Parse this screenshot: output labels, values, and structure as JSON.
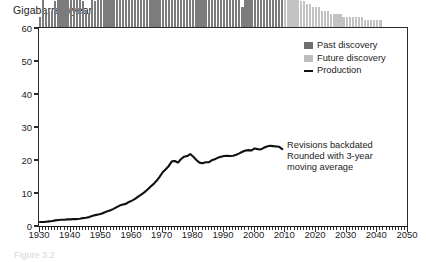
{
  "figure": {
    "axis_title": "Gigabarrels/year",
    "caption": "Figure 3.2"
  },
  "legend": {
    "position": "top-right",
    "items": [
      {
        "label": "Past discovery",
        "marker": "square",
        "color": "#6f6f6f"
      },
      {
        "label": "Future discovery",
        "marker": "square",
        "color": "#bdbdbd"
      },
      {
        "label": "Production",
        "marker": "line",
        "color": "#111111"
      }
    ]
  },
  "annotation": {
    "lines": [
      "Revisions backdated",
      "Rounded with 3-year",
      "moving average"
    ]
  },
  "colors": {
    "past_discovery": "#7c7c7c",
    "future_discovery": "#c3c3c3",
    "production_line": "#111111",
    "axis": "#2b2b2b",
    "background": "#ffffff"
  },
  "chart_data": {
    "type": "bar",
    "title": "Gigabarrels/year",
    "xlabel": "",
    "ylabel": "Gigabarrels/year",
    "xlim": [
      1930,
      2050
    ],
    "ylim": [
      0,
      60
    ],
    "yticks": [
      0,
      10,
      20,
      30,
      40,
      50,
      60
    ],
    "xticks": [
      1930,
      1940,
      1950,
      1960,
      1970,
      1980,
      1990,
      2000,
      2010,
      2020,
      2030,
      2040,
      2050
    ],
    "xtick_minor_step": 1,
    "grid": false,
    "legend_position": "top-right",
    "x": [
      1930,
      1931,
      1932,
      1933,
      1934,
      1935,
      1936,
      1937,
      1938,
      1939,
      1940,
      1941,
      1942,
      1943,
      1944,
      1945,
      1946,
      1947,
      1948,
      1949,
      1950,
      1951,
      1952,
      1953,
      1954,
      1955,
      1956,
      1957,
      1958,
      1959,
      1960,
      1961,
      1962,
      1963,
      1964,
      1965,
      1966,
      1967,
      1968,
      1969,
      1970,
      1971,
      1972,
      1973,
      1974,
      1975,
      1976,
      1977,
      1978,
      1979,
      1980,
      1981,
      1982,
      1983,
      1984,
      1985,
      1986,
      1987,
      1988,
      1989,
      1990,
      1991,
      1992,
      1993,
      1994,
      1995,
      1996,
      1997,
      1998,
      1999,
      2000,
      2001,
      2002,
      2003,
      2004,
      2005,
      2006,
      2007,
      2008,
      2009,
      2010,
      2011,
      2012,
      2013,
      2014,
      2015,
      2016,
      2017,
      2018,
      2019,
      2020,
      2021,
      2022,
      2023,
      2024,
      2025,
      2026,
      2027,
      2028,
      2029,
      2030,
      2031,
      2032,
      2033,
      2034,
      2035,
      2036,
      2037,
      2038,
      2039,
      2040,
      2041
    ],
    "series": [
      {
        "name": "Past discovery",
        "color": "#7c7c7c",
        "type": "bar",
        "values": [
          3,
          9,
          4,
          5,
          5,
          8,
          13,
          48,
          44,
          51,
          13,
          11,
          10,
          11,
          8,
          5,
          4,
          10,
          8,
          13,
          14,
          49,
          52,
          54,
          21,
          22,
          20,
          30,
          28,
          37,
          44,
          45,
          43,
          46,
          50,
          45,
          58,
          59,
          57,
          36,
          34,
          33,
          32,
          28,
          28,
          31,
          21,
          18,
          18,
          19,
          33,
          39,
          34,
          17,
          20,
          20,
          16,
          14,
          16,
          15,
          15,
          13,
          13,
          10,
          11,
          9,
          6,
          10,
          9,
          14,
          26,
          23,
          15,
          14,
          12,
          18,
          16,
          14,
          13,
          12,
          null,
          null,
          null,
          null,
          null,
          null,
          null,
          null,
          null,
          null,
          null,
          null,
          null,
          null,
          null,
          null,
          null,
          null,
          null,
          null,
          null,
          null,
          null,
          null,
          null,
          null,
          null,
          null,
          null,
          null,
          null,
          null
        ]
      },
      {
        "name": "Future discovery",
        "color": "#c3c3c3",
        "type": "bar",
        "values": [
          null,
          null,
          null,
          null,
          null,
          null,
          null,
          null,
          null,
          null,
          null,
          null,
          null,
          null,
          null,
          null,
          null,
          null,
          null,
          null,
          null,
          null,
          null,
          null,
          null,
          null,
          null,
          null,
          null,
          null,
          null,
          null,
          null,
          null,
          null,
          null,
          null,
          null,
          null,
          null,
          null,
          null,
          null,
          null,
          null,
          null,
          null,
          null,
          null,
          null,
          null,
          null,
          null,
          null,
          null,
          null,
          null,
          null,
          null,
          null,
          null,
          null,
          null,
          null,
          null,
          null,
          null,
          null,
          null,
          null,
          null,
          null,
          null,
          null,
          null,
          null,
          null,
          null,
          null,
          null,
          11,
          11,
          10,
          10,
          9,
          8,
          8,
          7,
          7,
          6,
          6,
          6,
          5,
          5,
          5,
          4,
          4,
          4,
          4,
          3,
          3,
          3,
          3,
          3,
          3,
          3,
          2,
          2,
          2,
          2,
          2,
          2
        ]
      },
      {
        "name": "Production",
        "color": "#111111",
        "type": "line",
        "values": [
          1.5,
          1.5,
          1.6,
          1.7,
          1.8,
          2.0,
          2.1,
          2.2,
          2.2,
          2.3,
          2.3,
          2.4,
          2.4,
          2.5,
          2.7,
          2.8,
          3.0,
          3.3,
          3.6,
          3.8,
          4.0,
          4.4,
          4.8,
          5.1,
          5.5,
          6.0,
          6.5,
          6.8,
          7.0,
          7.6,
          8.0,
          8.5,
          9.2,
          9.8,
          10.5,
          11.3,
          12.2,
          13.0,
          14.0,
          15.2,
          16.6,
          17.5,
          18.5,
          19.9,
          20.0,
          19.5,
          20.6,
          21.3,
          21.5,
          22.1,
          21.3,
          20.3,
          19.5,
          19.3,
          19.6,
          19.6,
          20.2,
          20.5,
          21.0,
          21.3,
          21.5,
          21.6,
          21.5,
          21.6,
          21.9,
          22.3,
          22.8,
          23.2,
          23.3,
          23.2,
          23.8,
          23.6,
          23.5,
          24.0,
          24.4,
          24.6,
          24.5,
          24.4,
          24.3,
          23.6,
          null,
          null,
          null,
          null,
          null,
          null,
          null,
          null,
          null,
          null,
          null,
          null,
          null,
          null,
          null,
          null,
          null,
          null,
          null,
          null,
          null,
          null,
          null,
          null,
          null,
          null,
          null,
          null,
          null,
          null,
          null,
          null
        ]
      }
    ]
  }
}
